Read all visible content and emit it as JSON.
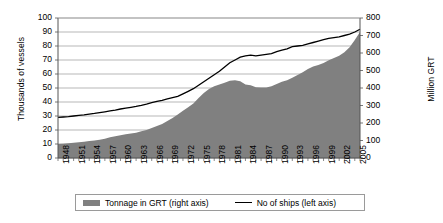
{
  "chart_data": {
    "type": "area",
    "title": "",
    "xlabel": "",
    "ylabel": "Thousands of vessels",
    "ylabel_right": "Million GRT",
    "ylim": [
      0,
      100
    ],
    "ylim_right": [
      0,
      800
    ],
    "yticks": [
      0,
      10,
      20,
      30,
      40,
      50,
      60,
      70,
      80,
      90,
      100
    ],
    "yticks_right": [
      0,
      100,
      200,
      300,
      400,
      500,
      600,
      700,
      800
    ],
    "grid": true,
    "legend_position": "bottom",
    "xlim": [
      1948,
      2006
    ],
    "xtick_labels": [
      "1948",
      "1951",
      "1954",
      "1957",
      "1960",
      "1963",
      "1966",
      "1969",
      "1972",
      "1975",
      "1978",
      "1981",
      "1984",
      "1987",
      "1990",
      "1993",
      "1996",
      "1999",
      "2002",
      "2005"
    ],
    "x": [
      1948,
      1949,
      1950,
      1951,
      1952,
      1953,
      1954,
      1955,
      1956,
      1957,
      1958,
      1959,
      1960,
      1961,
      1962,
      1963,
      1964,
      1965,
      1966,
      1967,
      1968,
      1969,
      1970,
      1971,
      1972,
      1973,
      1974,
      1975,
      1976,
      1977,
      1978,
      1979,
      1980,
      1981,
      1982,
      1983,
      1984,
      1985,
      1986,
      1987,
      1988,
      1989,
      1990,
      1991,
      1992,
      1993,
      1994,
      1995,
      1996,
      1997,
      1998,
      1999,
      2000,
      2001,
      2002,
      2003,
      2004,
      2005,
      2006
    ],
    "series": [
      {
        "name": "Tonnage in GRT (right axis)",
        "axis": "right",
        "kind": "area",
        "color": "#808080",
        "units": "Million GRT",
        "values": [
          80,
          82,
          84,
          87,
          90,
          93,
          97,
          100,
          105,
          110,
          118,
          124,
          130,
          136,
          140,
          145,
          153,
          160,
          172,
          183,
          195,
          212,
          228,
          248,
          270,
          290,
          312,
          343,
          372,
          394,
          410,
          420,
          430,
          442,
          445,
          438,
          420,
          416,
          404,
          403,
          403,
          410,
          423,
          436,
          445,
          458,
          475,
          490,
          508,
          523,
          532,
          543,
          558,
          572,
          585,
          605,
          633,
          675,
          720
        ]
      },
      {
        "name": "No of ships (left axis)",
        "axis": "left",
        "kind": "line",
        "color": "#000000",
        "units": "Thousands of vessels",
        "values": [
          29,
          29.3,
          29.6,
          30,
          30.4,
          30.8,
          31.3,
          31.8,
          32.4,
          33,
          33.6,
          34.2,
          35,
          35.6,
          36.2,
          36.8,
          37.6,
          38.5,
          39.5,
          40.4,
          41.2,
          42.2,
          43.2,
          44,
          45.8,
          47.6,
          49.5,
          52,
          54.5,
          57,
          59.5,
          62,
          65,
          68,
          70,
          72,
          73,
          73.5,
          73,
          73.5,
          74,
          74.5,
          76,
          77,
          78,
          79.5,
          80,
          80.5,
          81.5,
          82.5,
          83.5,
          84.5,
          85.5,
          86,
          86.5,
          87.5,
          88.5,
          90,
          92
        ]
      }
    ]
  },
  "legend": {
    "items": [
      {
        "label": "Tonnage in GRT (right axis)",
        "marker": "area-swatch"
      },
      {
        "label": "No of ships (left axis)",
        "marker": "line-swatch"
      }
    ]
  },
  "colors": {
    "area_fill": "#808080",
    "line": "#000000",
    "grid": "#9a9a9a",
    "axis": "#555555"
  }
}
